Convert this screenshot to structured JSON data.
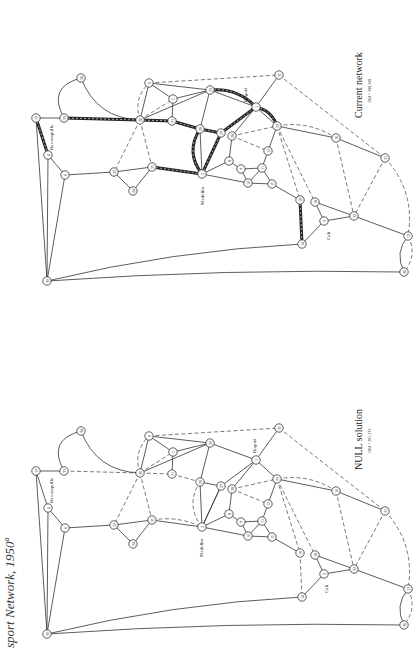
{
  "page": {
    "caption": "sport Network, 1950",
    "caption_superscript": "a"
  },
  "panels": [
    {
      "id": "current",
      "title": "Current network",
      "obj": "OBJ = 388,348",
      "cities": {
        "medellin": "Medellin",
        "bogota": "Bogotá",
        "cali": "Cali",
        "barranquilla": "Barranquilla"
      }
    },
    {
      "id": "null",
      "title": "NULL solution",
      "obj": "OBJ = 381,333",
      "cities": {
        "medellin": "Medellin",
        "bogota": "Bogotá",
        "cali": "Cali",
        "barranquilla": "Barranquilla"
      }
    }
  ],
  "chart_data": {
    "type": "network",
    "panels": [
      {
        "name": "Current network",
        "objective": 388348
      },
      {
        "name": "NULL solution",
        "objective": 381333
      }
    ],
    "nodes": [
      {
        "id": "17",
        "x": 36,
        "y": 118
      },
      {
        "id": "4",
        "x": 48,
        "y": 155
      },
      {
        "id": "6",
        "x": 65,
        "y": 175
      },
      {
        "id": "30",
        "x": 47,
        "y": 281
      },
      {
        "id": "33",
        "x": 64,
        "y": 118
      },
      {
        "id": "34",
        "x": 81,
        "y": 78
      },
      {
        "id": "22",
        "x": 114,
        "y": 172
      },
      {
        "id": "24",
        "x": 133,
        "y": 191
      },
      {
        "id": "25",
        "x": 152,
        "y": 167
      },
      {
        "id": "9",
        "x": 149,
        "y": 83
      },
      {
        "id": "5",
        "x": 173,
        "y": 99
      },
      {
        "id": "21",
        "x": 172,
        "y": 121
      },
      {
        "id": "26",
        "x": 140,
        "y": 120
      },
      {
        "id": "20",
        "x": 210,
        "y": 90
      },
      {
        "id": "29",
        "x": 200,
        "y": 129
      },
      {
        "id": "27",
        "x": 221,
        "y": 133
      },
      {
        "id": "28",
        "x": 232,
        "y": 136
      },
      {
        "id": "1",
        "x": 256,
        "y": 107
      },
      {
        "id": "2",
        "x": 202,
        "y": 174
      },
      {
        "id": "8",
        "x": 229,
        "y": 161
      },
      {
        "id": "7",
        "x": 241,
        "y": 169
      },
      {
        "id": "11",
        "x": 262,
        "y": 168
      },
      {
        "id": "10",
        "x": 248,
        "y": 183
      },
      {
        "id": "15",
        "x": 272,
        "y": 184
      },
      {
        "id": "12",
        "x": 268,
        "y": 151
      },
      {
        "id": "23",
        "x": 277,
        "y": 126
      },
      {
        "id": "19",
        "x": 300,
        "y": 200
      },
      {
        "id": "18",
        "x": 315,
        "y": 202
      },
      {
        "id": "3",
        "x": 324,
        "y": 221
      },
      {
        "id": "14",
        "x": 302,
        "y": 244
      },
      {
        "id": "32",
        "x": 354,
        "y": 216
      },
      {
        "id": "16",
        "x": 336,
        "y": 138
      },
      {
        "id": "31",
        "x": 385,
        "y": 158
      },
      {
        "id": "13",
        "x": 408,
        "y": 236
      },
      {
        "id": "36",
        "x": 404,
        "y": 272
      },
      {
        "id": "35",
        "x": 279,
        "y": 75
      }
    ]
  }
}
